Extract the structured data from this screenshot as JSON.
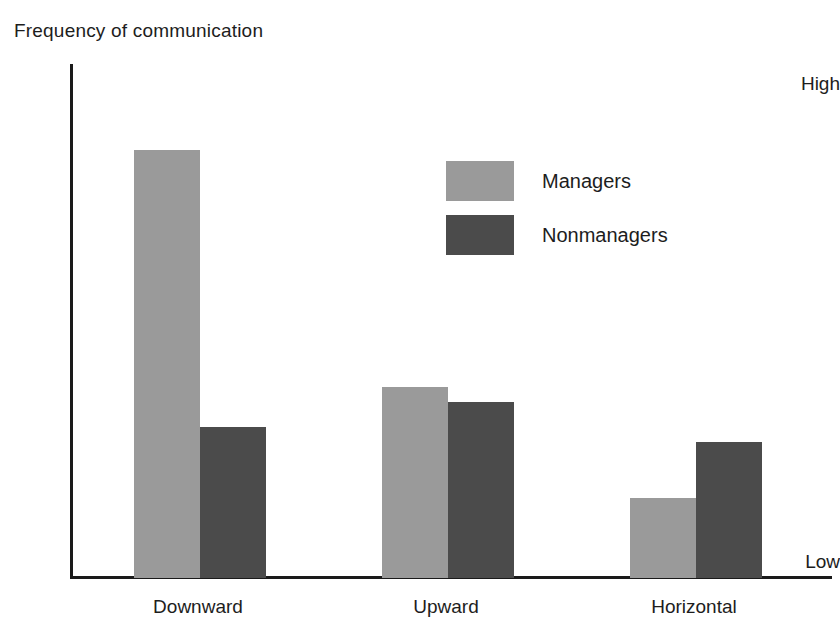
{
  "chart_data": {
    "type": "bar",
    "title": "Frequency of communication",
    "xlabel": "",
    "ylabel": "Frequency of communication",
    "categories": [
      "Downward",
      "Upward",
      "Horizontal"
    ],
    "series": [
      {
        "name": "Managers",
        "color": "#9a9a9a",
        "values": [
          85,
          38,
          16
        ]
      },
      {
        "name": "Nonmanagers",
        "color": "#4b4b4b",
        "values": [
          30,
          35,
          27
        ]
      }
    ],
    "ylim": [
      0,
      100
    ],
    "y_tick_labels": {
      "top": "High",
      "bottom": "Low"
    },
    "grid": false,
    "legend_position": "upper-center-right",
    "axis_color": "#1a1a1a",
    "background": "#ffffff"
  },
  "legend": {
    "items": [
      {
        "label": "Managers"
      },
      {
        "label": "Nonmanagers"
      }
    ]
  }
}
